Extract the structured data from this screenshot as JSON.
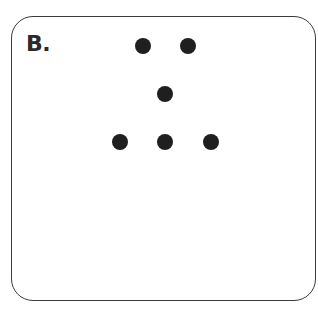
{
  "panel": {
    "label": "B.",
    "border_color": "#3a3a3a",
    "dot_color": "#1f1f1f"
  },
  "dots": [
    {
      "row": 1,
      "x": 143,
      "y": 46
    },
    {
      "row": 1,
      "x": 188,
      "y": 46
    },
    {
      "row": 2,
      "x": 165,
      "y": 94
    },
    {
      "row": 3,
      "x": 120,
      "y": 142
    },
    {
      "row": 3,
      "x": 165,
      "y": 142
    },
    {
      "row": 3,
      "x": 211,
      "y": 142
    }
  ]
}
